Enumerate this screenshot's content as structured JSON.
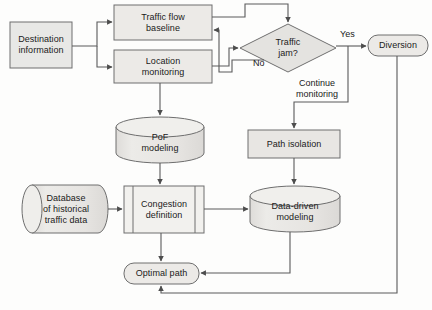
{
  "diagram": {
    "type": "flowchart",
    "canvas": {
      "width": 432,
      "height": 310
    },
    "style": {
      "fill": "#e8e8e6",
      "stroke": "#6e6e6e",
      "line": "#5a5a5a",
      "text": "#1a1a1a"
    },
    "nodes": [
      {
        "id": "destination-information",
        "label": "Destination\ninformation",
        "shape": "rectangle",
        "x": 10,
        "y": 22,
        "w": 62,
        "h": 46
      },
      {
        "id": "traffic-flow-baseline",
        "label": "Traffic flow\nbaseline",
        "shape": "rectangle",
        "x": 114,
        "y": 5,
        "w": 98,
        "h": 35
      },
      {
        "id": "location-monitoring",
        "label": "Location\nmonitoring",
        "shape": "rectangle",
        "x": 114,
        "y": 50,
        "w": 98,
        "h": 33
      },
      {
        "id": "traffic-jam-decision",
        "label": "Traffic\njam?",
        "shape": "diamond",
        "x": 240,
        "y": 24,
        "w": 96,
        "h": 48
      },
      {
        "id": "diversion",
        "label": "Diversion",
        "shape": "rounded",
        "x": 368,
        "y": 35,
        "w": 60,
        "h": 21
      },
      {
        "id": "pof-modeling",
        "label": "PoF\nmodeling",
        "shape": "cylinder-vertical",
        "x": 116,
        "y": 117,
        "w": 88,
        "h": 46
      },
      {
        "id": "path-isolation",
        "label": "Path isolation",
        "shape": "rectangle",
        "x": 248,
        "y": 130,
        "w": 92,
        "h": 28
      },
      {
        "id": "database-historical-traffic-data",
        "label": "Database\nof historical\ntraffic data",
        "shape": "cylinder-horizontal",
        "x": 22,
        "y": 185,
        "w": 86,
        "h": 48
      },
      {
        "id": "congestion-definition",
        "label": "Congestion\ndefinition",
        "shape": "predefined-process",
        "x": 124,
        "y": 186,
        "w": 80,
        "h": 47
      },
      {
        "id": "data-driven-modeling",
        "label": "Data-driven\nmodeling",
        "shape": "cylinder-vertical",
        "x": 250,
        "y": 186,
        "w": 90,
        "h": 46
      },
      {
        "id": "optimal-path",
        "label": "Optimal path",
        "shape": "rounded",
        "x": 124,
        "y": 263,
        "w": 75,
        "h": 21
      }
    ],
    "edge_labels": [
      {
        "id": "yes-label",
        "text": "Yes",
        "x": 340,
        "y": 29
      },
      {
        "id": "no-label",
        "text": "No",
        "x": 253,
        "y": 58
      },
      {
        "id": "continue-monitoring-label",
        "text": "Continue\nmonitoring",
        "x": 296,
        "y": 78
      }
    ],
    "edges": [
      {
        "id": "destination-to-traffic-flow-baseline",
        "from": "destination-information",
        "to": "traffic-flow-baseline"
      },
      {
        "id": "destination-to-location-monitoring",
        "from": "destination-information",
        "to": "location-monitoring"
      },
      {
        "id": "traffic-flow-baseline-to-decision",
        "from": "traffic-flow-baseline",
        "to": "traffic-jam-decision"
      },
      {
        "id": "location-monitoring-to-decision",
        "from": "location-monitoring",
        "to": "traffic-jam-decision"
      },
      {
        "id": "decision-no-to-traffic-flow-baseline",
        "from": "traffic-jam-decision",
        "to": "traffic-flow-baseline",
        "label": "No"
      },
      {
        "id": "decision-yes-to-diversion",
        "from": "traffic-jam-decision",
        "to": "diversion",
        "label": "Yes"
      },
      {
        "id": "decision-continue-to-path-isolation",
        "from": "traffic-jam-decision",
        "to": "path-isolation",
        "label": "Continue monitoring"
      },
      {
        "id": "location-monitoring-to-pof-modeling",
        "from": "location-monitoring",
        "to": "pof-modeling"
      },
      {
        "id": "pof-modeling-to-congestion-definition",
        "from": "pof-modeling",
        "to": "congestion-definition"
      },
      {
        "id": "database-to-congestion-definition",
        "from": "database-historical-traffic-data",
        "to": "congestion-definition"
      },
      {
        "id": "path-isolation-to-data-driven-modeling",
        "from": "path-isolation",
        "to": "data-driven-modeling"
      },
      {
        "id": "congestion-definition-to-data-driven-modeling",
        "from": "congestion-definition",
        "to": "data-driven-modeling"
      },
      {
        "id": "congestion-definition-to-optimal-path",
        "from": "congestion-definition",
        "to": "optimal-path"
      },
      {
        "id": "data-driven-modeling-to-optimal-path",
        "from": "data-driven-modeling",
        "to": "optimal-path"
      },
      {
        "id": "diversion-to-optimal-path",
        "from": "diversion",
        "to": "optimal-path"
      }
    ]
  }
}
